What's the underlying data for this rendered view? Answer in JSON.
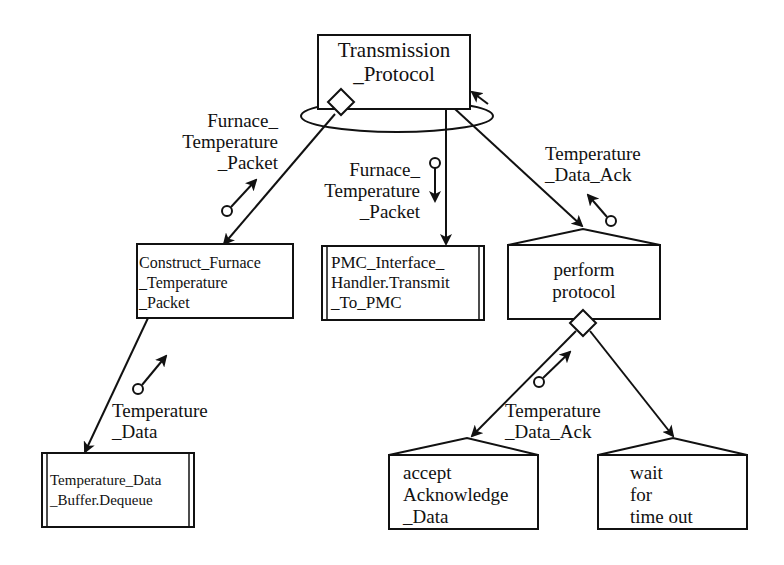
{
  "diagram": {
    "type": "structure-chart",
    "nodes": {
      "root": {
        "label": "Transmission\n_Protocol"
      },
      "construct": {
        "label": "Construct_Furnace\n_Temperature\n_Packet"
      },
      "transmit": {
        "label": "PMC_Interface_\nHandler.Transmit\n_To_PMC"
      },
      "perform": {
        "label": "perform\nprotocol"
      },
      "dequeue": {
        "label": "Temperature_Data\n_Buffer.Dequeue"
      },
      "accept": {
        "label": "accept\nAcknowledge\n_Data"
      },
      "wait": {
        "label": "wait\nfor\ntime out"
      }
    },
    "couples": {
      "root_construct": {
        "label": "Furnace_\nTemperature\n_Packet",
        "direction": "up"
      },
      "root_transmit": {
        "label": "Furnace_\nTemperature\n_Packet",
        "direction": "down"
      },
      "root_perform": {
        "label": "Temperature\n_Data_Ack",
        "direction": "up"
      },
      "construct_dequeue": {
        "label": "Temperature\n_Data",
        "direction": "up"
      },
      "perform_accept": {
        "label": "Temperature\n_Data_Ack",
        "direction": "up"
      }
    },
    "colors": {
      "stroke": "#111111",
      "background": "#ffffff"
    }
  }
}
